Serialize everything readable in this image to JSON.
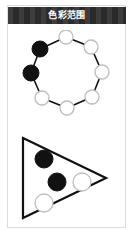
{
  "window": {
    "title": "色彩范围",
    "title_bar_color": "#2b2b2b",
    "title_text_color": "#ffffff",
    "card_background": "#ffffff",
    "card_border_color": "#dcdcdc"
  },
  "figures": [
    {
      "name": "node-ring-diagram",
      "shape": "ring",
      "stroke_color": "#111111",
      "node_fill_filled": "#111111",
      "node_fill_empty": "#ffffff",
      "node_stroke_empty": "#bdbdbd",
      "node_count": 9,
      "filled_count": 2,
      "empty_count": 7,
      "nodes": [
        {
          "index": 0,
          "label": "top",
          "state": "empty",
          "cx": 58,
          "cy": 7,
          "r": 7
        },
        {
          "index": 1,
          "label": "upper-right",
          "state": "empty",
          "cx": 83,
          "cy": 17,
          "r": 7
        },
        {
          "index": 2,
          "label": "right",
          "state": "empty",
          "cx": 94,
          "cy": 42,
          "r": 7
        },
        {
          "index": 3,
          "label": "lower-right",
          "state": "empty",
          "cx": 84,
          "cy": 67,
          "r": 7
        },
        {
          "index": 4,
          "label": "bottom",
          "state": "empty",
          "cx": 59,
          "cy": 78,
          "r": 7
        },
        {
          "index": 5,
          "label": "bottom-left",
          "state": "empty",
          "cx": 34,
          "cy": 68,
          "r": 7
        },
        {
          "index": 6,
          "label": "left",
          "state": "filled",
          "cx": 23,
          "cy": 43,
          "r": 8
        },
        {
          "index": 7,
          "label": "upper-left",
          "state": "filled",
          "cx": 32,
          "cy": 19,
          "r": 8
        }
      ]
    },
    {
      "name": "triangle-diagram",
      "shape": "triangle",
      "orientation": "points-right",
      "stroke_color": "#111111",
      "node_fill_filled": "#111111",
      "node_fill_empty": "#ffffff",
      "node_stroke_empty": "#bdbdbd",
      "vertices": [
        {
          "label": "top-left",
          "x": 15,
          "y": 4
        },
        {
          "label": "apex-right",
          "x": 98,
          "y": 44
        },
        {
          "label": "bottom-left",
          "x": 15,
          "y": 84
        }
      ],
      "node_count": 4,
      "filled_count": 2,
      "empty_count": 2,
      "nodes": [
        {
          "index": 0,
          "label": "upper-black",
          "state": "filled",
          "cx": 36,
          "cy": 25,
          "r": 9
        },
        {
          "index": 1,
          "label": "middle-black",
          "state": "filled",
          "cx": 49,
          "cy": 48,
          "r": 9
        },
        {
          "index": 2,
          "label": "middle-white",
          "state": "empty",
          "cx": 74,
          "cy": 48,
          "r": 9
        },
        {
          "index": 3,
          "label": "lower-white",
          "state": "empty",
          "cx": 36,
          "cy": 69,
          "r": 9
        }
      ]
    }
  ]
}
